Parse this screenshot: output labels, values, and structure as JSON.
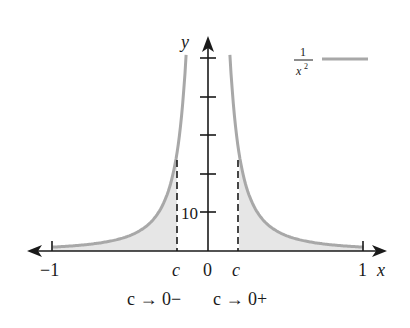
{
  "figure": {
    "function_label_numerator": "1",
    "function_label_denominator": "x",
    "function_label_exponent": "2",
    "curve_color": "#a8a8a8",
    "fill_color": "#e6e6e6",
    "axis_color": "#1a1a1a"
  },
  "axes": {
    "x_label": "x",
    "y_label": "y",
    "x_ticks": [
      {
        "label": "−1",
        "value": -1
      },
      {
        "label": "c",
        "value": -0.2
      },
      {
        "label": "0",
        "value": 0
      },
      {
        "label": "c",
        "value": 0.2
      },
      {
        "label": "1",
        "value": 1
      }
    ],
    "y_tick_label": "10",
    "y_tick_count": 5,
    "y_tick_spacing": 10
  },
  "annotations": {
    "left_limit": "c → 0−",
    "right_limit": "c → 0+"
  }
}
